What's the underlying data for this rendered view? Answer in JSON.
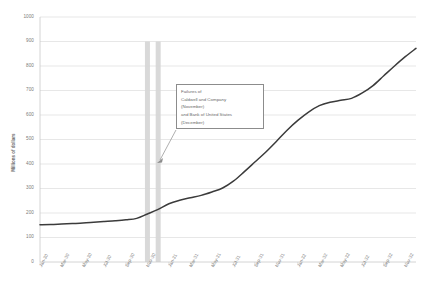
{
  "chart_data": {
    "type": "line",
    "title": "",
    "xlabel": "",
    "ylabel": "Millions of dollars",
    "ylim": [
      0,
      1000
    ],
    "ytick_labels": [
      "1000",
      "900",
      "800",
      "700",
      "600",
      "500",
      "400",
      "300",
      "200",
      "100",
      "0"
    ],
    "yticks": [
      1000,
      900,
      800,
      700,
      600,
      500,
      400,
      300,
      200,
      100,
      0
    ],
    "grid": true,
    "legend": "none",
    "x_tick_labels": [
      "Jan-30",
      "Mar-30",
      "May-30",
      "Jul-30",
      "Sep-30",
      "Nov-30",
      "Jan-31",
      "Mar-31",
      "May-31",
      "Jul-31",
      "Sep-31",
      "Nov-31",
      "Jan-32",
      "Mar-32",
      "May-32",
      "Jul-32",
      "Sep-32",
      "Nov-32"
    ],
    "x": [
      "Jan-30",
      "Feb-30",
      "Mar-30",
      "Apr-30",
      "May-30",
      "Jun-30",
      "Jul-30",
      "Aug-30",
      "Sep-30",
      "Oct-30",
      "Nov-30",
      "Dec-30",
      "Jan-31",
      "Feb-31",
      "Mar-31",
      "Apr-31",
      "May-31",
      "Jun-31",
      "Jul-31",
      "Aug-31",
      "Sep-31",
      "Oct-31",
      "Nov-31",
      "Dec-31",
      "Jan-32",
      "Feb-32",
      "Mar-32",
      "Apr-32",
      "May-32",
      "Jun-32",
      "Jul-32",
      "Aug-32",
      "Sep-32",
      "Oct-32",
      "Nov-32",
      "Dec-32"
    ],
    "values": [
      152,
      153,
      155,
      157,
      159,
      162,
      165,
      168,
      172,
      178,
      196,
      215,
      238,
      252,
      262,
      272,
      286,
      302,
      330,
      368,
      408,
      448,
      492,
      538,
      578,
      612,
      638,
      652,
      660,
      668,
      690,
      720,
      760,
      800,
      838,
      872
    ],
    "series": [
      {
        "name": "Currency held by the public",
        "values": [
          152,
          153,
          155,
          157,
          159,
          162,
          165,
          168,
          172,
          178,
          196,
          215,
          238,
          252,
          262,
          272,
          286,
          302,
          330,
          368,
          408,
          448,
          492,
          538,
          578,
          612,
          638,
          652,
          660,
          668,
          690,
          720,
          760,
          800,
          838,
          872
        ]
      }
    ],
    "vertical_bands": [
      {
        "label": "Nov-30",
        "from": "Nov-30",
        "to": "Nov-30",
        "color": "#d9d9d9"
      },
      {
        "label": "Dec-30",
        "from": "Dec-30",
        "to": "Dec-30",
        "color": "#d9d9d9"
      }
    ],
    "annotations": [
      {
        "name": "bank-failures-note",
        "lines": [
          "Failures of",
          "Caldwell and Company",
          "(November)",
          " and Bank of United States",
          "(December)"
        ],
        "points_to": "Nov-30 / Dec-30 bands"
      }
    ],
    "line_color": "#3b3b3b",
    "grid_color": "#d6d6d6",
    "band_color": "#d9d9d9"
  },
  "axis": {
    "y_title": "Millions of dollars"
  },
  "annotation": {
    "line1": "Failures of",
    "line2": "Caldwell and Company",
    "line3": "(November)",
    "line4": " and Bank of United States",
    "line5": "(December)"
  }
}
